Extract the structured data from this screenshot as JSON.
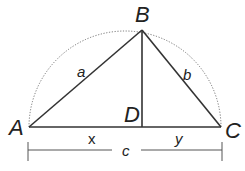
{
  "diagram": {
    "vertices": {
      "A": {
        "label": "A",
        "x": 29,
        "y": 127
      },
      "B": {
        "label": "B",
        "x": 142,
        "y": 30
      },
      "C": {
        "label": "C",
        "x": 221,
        "y": 127
      },
      "D": {
        "label": "D",
        "x": 142,
        "y": 127
      }
    },
    "sides": {
      "a": "a",
      "b": "b",
      "c": "c",
      "x": "x",
      "y": "y"
    },
    "colors": {
      "line": "#333333",
      "arc": "#555555",
      "text": "#222222"
    }
  }
}
